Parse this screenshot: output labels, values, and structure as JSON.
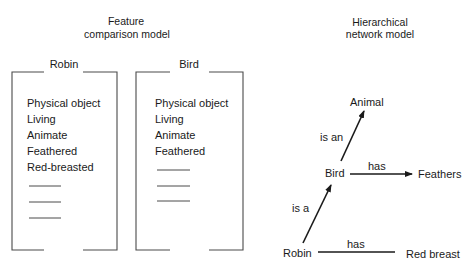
{
  "feature_model": {
    "title_line1": "Feature",
    "title_line2": "comparison model",
    "concepts": [
      {
        "name": "Robin",
        "features": [
          "Physical object",
          "Living",
          "Animate",
          "Feathered",
          "Red-breasted"
        ],
        "blank_feature_slots": 3
      },
      {
        "name": "Bird",
        "features": [
          "Physical object",
          "Living",
          "Animate",
          "Feathered"
        ],
        "blank_feature_slots": 3
      }
    ]
  },
  "network_model": {
    "title_line1": "Hierarchical",
    "title_line2": "network model",
    "nodes": {
      "animal": "Animal",
      "bird": "Bird",
      "feathers": "Feathers",
      "robin": "Robin",
      "red_breast": "Red breast"
    },
    "edges": {
      "bird_animal": "is an",
      "bird_feathers": "has",
      "robin_bird": "is a",
      "robin_red_breast": "has"
    }
  },
  "colors": {
    "ink": "#1a1a1a",
    "bracket": "#4a4a4a",
    "background": "#ffffff"
  }
}
